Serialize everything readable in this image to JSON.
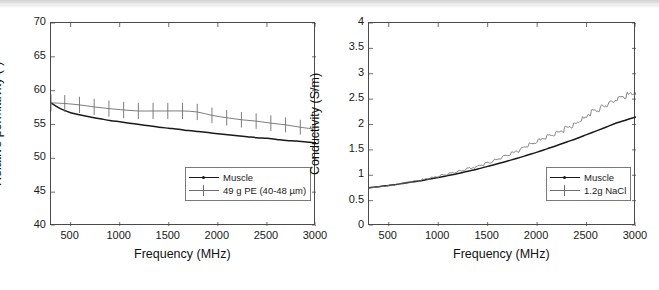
{
  "figure": {
    "background": "#ffffff",
    "axis_color": "#4a4a4a",
    "series_colors": {
      "muscle": "#1a1a1a",
      "sample": "#6e6e6e"
    }
  },
  "chart_data": [
    {
      "type": "line",
      "panel": "left",
      "title": "",
      "xlabel": "Frequency (MHz)",
      "ylabel": "Relative permittivity (-)",
      "xlim": [
        300,
        3000
      ],
      "ylim": [
        40,
        70
      ],
      "xticks": [
        500,
        1000,
        1500,
        2000,
        2500,
        3000
      ],
      "yticks": [
        40,
        45,
        50,
        55,
        60,
        65,
        70
      ],
      "xtick_labels": [
        "500",
        "1000",
        "1500",
        "2000",
        "2500",
        "3000"
      ],
      "ytick_labels": [
        "40",
        "45",
        "50",
        "55",
        "60",
        "65",
        "70"
      ],
      "grid": false,
      "legend_position": "lower right",
      "series": [
        {
          "name": "Muscle",
          "color": "#1a1a1a",
          "style": "solid",
          "x": [
            300,
            400,
            500,
            600,
            700,
            800,
            900,
            1000,
            1100,
            1200,
            1300,
            1400,
            1500,
            1600,
            1700,
            1800,
            1900,
            2000,
            2100,
            2200,
            2300,
            2400,
            2500,
            2600,
            2700,
            2800,
            2900,
            3000
          ],
          "y": [
            58.2,
            57.3,
            56.75,
            56.4,
            56.1,
            55.85,
            55.6,
            55.4,
            55.2,
            55.0,
            54.8,
            54.6,
            54.45,
            54.3,
            54.1,
            53.95,
            53.8,
            53.65,
            53.5,
            53.35,
            53.2,
            53.05,
            52.95,
            52.8,
            52.65,
            52.55,
            52.4,
            52.3
          ]
        },
        {
          "name": "49 g PE (40-48 µm)",
          "color": "#6e6e6e",
          "style": "errorbar",
          "x": [
            300,
            440,
            590,
            740,
            890,
            1040,
            1190,
            1340,
            1490,
            1640,
            1790,
            1940,
            2090,
            2240,
            2390,
            2540,
            2690,
            2840,
            2990
          ],
          "y": [
            58.2,
            58.1,
            57.9,
            57.6,
            57.35,
            57.15,
            57.0,
            57.0,
            57.0,
            57.0,
            56.85,
            56.35,
            56.0,
            55.7,
            55.5,
            55.2,
            54.95,
            54.6,
            54.3
          ],
          "yerr": [
            1.25,
            1.25,
            1.2,
            1.2,
            1.2,
            1.2,
            1.2,
            1.2,
            1.2,
            1.2,
            1.2,
            1.15,
            1.15,
            1.15,
            1.15,
            1.15,
            1.1,
            1.1,
            1.15
          ]
        }
      ]
    },
    {
      "type": "line",
      "panel": "right",
      "title": "",
      "xlabel": "Frequency (MHz)",
      "ylabel": "Conductivity (S/m)",
      "xlim": [
        300,
        3000
      ],
      "ylim": [
        0,
        4
      ],
      "xticks": [
        500,
        1000,
        1500,
        2000,
        2500,
        3000
      ],
      "yticks": [
        0,
        0.5,
        1,
        1.5,
        2,
        2.5,
        3,
        3.5,
        4
      ],
      "xtick_labels": [
        "500",
        "1000",
        "1500",
        "2000",
        "2500",
        "3000"
      ],
      "ytick_labels": [
        "0",
        "0.5",
        "1",
        "1.5",
        "2",
        "2.5",
        "3",
        "3.5",
        "4"
      ],
      "grid": false,
      "legend_position": "lower right",
      "series": [
        {
          "name": "Muscle",
          "color": "#1a1a1a",
          "style": "solid",
          "x": [
            300,
            400,
            500,
            600,
            700,
            800,
            900,
            1000,
            1100,
            1200,
            1300,
            1400,
            1500,
            1600,
            1700,
            1800,
            1900,
            2000,
            2100,
            2200,
            2300,
            2400,
            2500,
            2600,
            2700,
            2800,
            2900,
            3000
          ],
          "y": [
            0.755,
            0.775,
            0.8,
            0.825,
            0.855,
            0.885,
            0.92,
            0.955,
            0.995,
            1.035,
            1.08,
            1.125,
            1.175,
            1.225,
            1.28,
            1.335,
            1.395,
            1.455,
            1.52,
            1.585,
            1.655,
            1.725,
            1.8,
            1.875,
            1.95,
            2.03,
            2.09,
            2.15
          ]
        },
        {
          "name": "1.2g NaCl",
          "color": "#6e6e6e",
          "style": "noisy",
          "x": [
            300,
            390,
            480,
            570,
            660,
            750,
            840,
            930,
            1020,
            1110,
            1200,
            1290,
            1380,
            1470,
            1560,
            1650,
            1740,
            1830,
            1920,
            2010,
            2100,
            2190,
            2280,
            2370,
            2460,
            2550,
            2640,
            2730,
            2820,
            2910,
            3000
          ],
          "y": [
            0.75,
            0.77,
            0.79,
            0.815,
            0.845,
            0.875,
            0.91,
            0.945,
            0.985,
            1.03,
            1.07,
            1.115,
            1.165,
            1.215,
            1.28,
            1.345,
            1.42,
            1.5,
            1.585,
            1.665,
            1.75,
            1.82,
            1.9,
            1.99,
            2.1,
            2.22,
            2.32,
            2.42,
            2.5,
            2.58,
            2.62
          ],
          "noise_amplitude": 0.055
        }
      ]
    }
  ],
  "panels": {
    "left": {
      "legend": {
        "entries": [
          {
            "label": "Muscle",
            "marker": "line-dot"
          },
          {
            "label": "49 g PE (40-48 µm)",
            "marker": "line-errorbar"
          }
        ]
      }
    },
    "right": {
      "legend": {
        "entries": [
          {
            "label": "Muscle",
            "marker": "line-dot"
          },
          {
            "label": "1.2g NaCl",
            "marker": "line-errorbar"
          }
        ]
      }
    }
  }
}
